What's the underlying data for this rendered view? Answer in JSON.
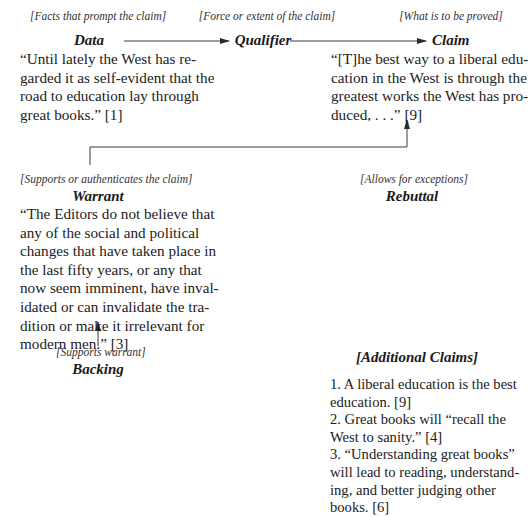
{
  "diagram": {
    "type": "Toulmin argument model",
    "data": {
      "sublabel": "[Facts that prompt the claim]",
      "heading": "Data",
      "quote_lines": [
        "“Until lately the West has re-",
        "garded it as self-evident that the",
        "road to education lay through",
        "great books.” [1]"
      ]
    },
    "qualifier": {
      "sublabel": "[Force or extent of the claim]",
      "heading": "Qualifier"
    },
    "claim": {
      "sublabel": "[What is to be proved]",
      "heading": "Claim",
      "quote_lines": [
        "“[T]he best way to a liberal edu-",
        "cation in the West is through the",
        "greatest works the West has pro-",
        "duced, . . .” [9]"
      ]
    },
    "warrant": {
      "sublabel": "[Supports or authenticates the claim]",
      "heading": "Warrant",
      "quote_lines": [
        "“The Editors do not believe that",
        "any of the social and political",
        "changes that have taken place in",
        "the last fifty years, or any that",
        "now seem imminent, have inval-",
        "idated or can invalidate the tra-",
        "dition or make it irrelevant for",
        "modern men.” [3]"
      ]
    },
    "rebuttal": {
      "sublabel": "[Allows for exceptions]",
      "heading": "Rebuttal"
    },
    "backing": {
      "sublabel": "[Supports warrant]",
      "heading": "Backing"
    },
    "additional_claims": {
      "heading": "[Additional Claims]",
      "lines": [
        "1. A liberal education is the best",
        "education. [9]",
        "2. Great books will “recall the",
        "West to sanity.” [4]",
        "3. “Understanding great books”",
        "will lead to reading, understand-",
        "ing, and better judging other",
        "books. [6]"
      ]
    },
    "connectors": [
      {
        "from": "Data",
        "to": "Qualifier"
      },
      {
        "from": "Qualifier",
        "to": "Claim"
      },
      {
        "from": "Warrant",
        "to": "Claim"
      },
      {
        "from": "Backing",
        "to": "Warrant"
      }
    ],
    "line_color": "#3a3a3a"
  }
}
